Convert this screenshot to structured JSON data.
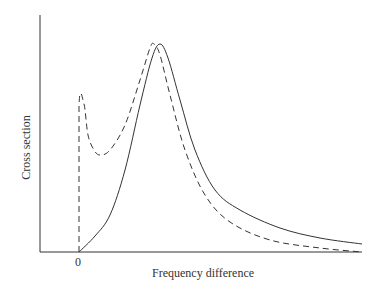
{
  "chart_data": {
    "type": "line",
    "title": "",
    "xlabel": "Frequency difference",
    "ylabel": "Cross section",
    "x_tick_labels": [
      "0"
    ],
    "grid": false,
    "legend": null,
    "series": [
      {
        "name": "solid",
        "style": "solid",
        "description": "Starts at 0 at zero frequency difference, rises to a single peak, then decays with a long tail",
        "points_px": [
          [
            79,
            252
          ],
          [
            95,
            236
          ],
          [
            110,
            215
          ],
          [
            125,
            170
          ],
          [
            140,
            105
          ],
          [
            152,
            58
          ],
          [
            160,
            44
          ],
          [
            168,
            58
          ],
          [
            180,
            100
          ],
          [
            195,
            150
          ],
          [
            215,
            190
          ],
          [
            240,
            210
          ],
          [
            280,
            228
          ],
          [
            320,
            238
          ],
          [
            362,
            244
          ]
        ]
      },
      {
        "name": "dashed",
        "style": "dashed",
        "description": "Vertical jump at zero, sharp spike, dip, peak slightly left of solid peak, then decays below solid curve",
        "points_px": [
          [
            79,
            252
          ],
          [
            79,
            106
          ],
          [
            84,
            104
          ],
          [
            88,
            135
          ],
          [
            94,
            150
          ],
          [
            100,
            155
          ],
          [
            110,
            150
          ],
          [
            125,
            125
          ],
          [
            140,
            80
          ],
          [
            150,
            48
          ],
          [
            154,
            44
          ],
          [
            160,
            55
          ],
          [
            170,
            95
          ],
          [
            185,
            150
          ],
          [
            205,
            195
          ],
          [
            230,
            222
          ],
          [
            270,
            240
          ],
          [
            320,
            248
          ],
          [
            362,
            252
          ]
        ]
      }
    ],
    "axes_px": {
      "origin": [
        40,
        252
      ],
      "x_end": 362,
      "y_top": 15,
      "zero_x": 79
    }
  },
  "labels": {
    "xlabel": "Frequency difference",
    "ylabel": "Cross section",
    "tick0": "0"
  }
}
